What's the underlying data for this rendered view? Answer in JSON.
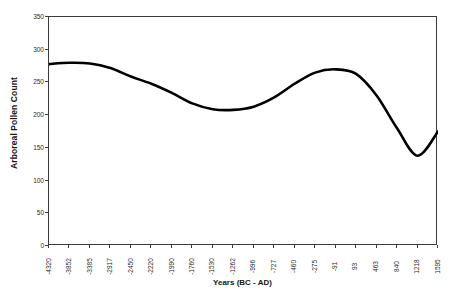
{
  "chart_data": {
    "type": "line",
    "title": "",
    "xlabel": "Years (BC - AD)",
    "ylabel": "Arboreal Pollen Count",
    "xlim": [
      -4320,
      1595
    ],
    "ylim": [
      0,
      350
    ],
    "grid": false,
    "legend": null,
    "y_ticks": [
      350,
      300,
      250,
      200,
      150,
      100,
      50,
      0
    ],
    "x_ticks": [
      "-4320",
      "-3852",
      "-3385",
      "-2917",
      "-2450",
      "-2220",
      "-1990",
      "-1760",
      "-1530",
      "-1262",
      "-996",
      "-727",
      "-460",
      "-275",
      "-91",
      "93",
      "463",
      "840",
      "1218",
      "1595"
    ],
    "series": [
      {
        "name": "Arboreal Pollen Count",
        "color": "#000000",
        "points": [
          {
            "x": "-4320",
            "y": 278
          },
          {
            "x": "-3852",
            "y": 280
          },
          {
            "x": "-3385",
            "y": 279
          },
          {
            "x": "-2917",
            "y": 272
          },
          {
            "x": "-2450",
            "y": 259
          },
          {
            "x": "-2220",
            "y": 248
          },
          {
            "x": "-1990",
            "y": 234
          },
          {
            "x": "-1760",
            "y": 218
          },
          {
            "x": "-1530",
            "y": 209
          },
          {
            "x": "-1262",
            "y": 208
          },
          {
            "x": "-996",
            "y": 213
          },
          {
            "x": "-727",
            "y": 227
          },
          {
            "x": "-460",
            "y": 248
          },
          {
            "x": "-275",
            "y": 265
          },
          {
            "x": "-91",
            "y": 270
          },
          {
            "x": "93",
            "y": 263
          },
          {
            "x": "463",
            "y": 230
          },
          {
            "x": "840",
            "y": 180
          },
          {
            "x": "1218",
            "y": 138
          },
          {
            "x": "1595",
            "y": 175
          }
        ]
      }
    ]
  }
}
